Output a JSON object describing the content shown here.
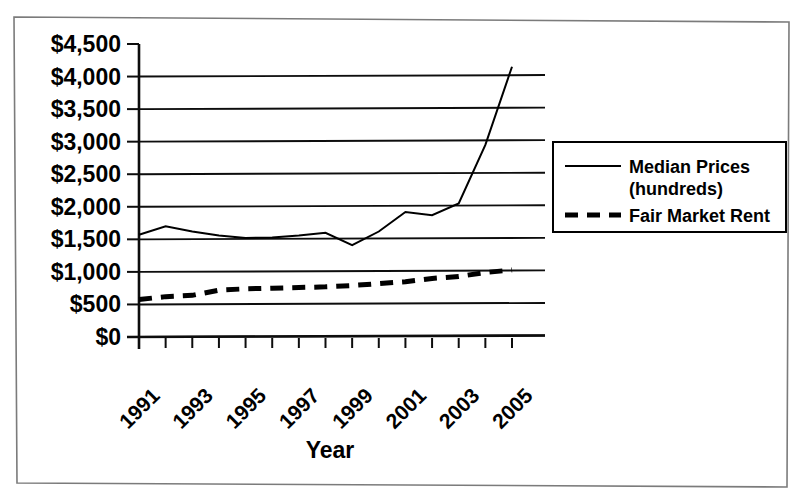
{
  "chart_data": {
    "type": "line",
    "title": "",
    "xlabel": "Year",
    "ylabel": "",
    "grid": true,
    "legend_position": "right",
    "x": [
      1991,
      1992,
      1993,
      1994,
      1995,
      1996,
      1997,
      1998,
      1999,
      2000,
      2001,
      2002,
      2003,
      2004,
      2005
    ],
    "xtick_labels": [
      "1991",
      "1993",
      "1995",
      "1997",
      "1999",
      "2001",
      "2003",
      "2005"
    ],
    "xtick_years": [
      1991,
      1993,
      1995,
      1997,
      1999,
      2001,
      2003,
      2005
    ],
    "ytick_labels": [
      "$4,500",
      "$4,000",
      "$3,500",
      "$3,000",
      "$2,500",
      "$2,000",
      "$1,500",
      "$1,000",
      "$500",
      "$0"
    ],
    "ytick_values": [
      4500,
      4000,
      3500,
      3000,
      2500,
      2000,
      1500,
      1000,
      500,
      0
    ],
    "ylim": [
      0,
      4500
    ],
    "xlim": [
      1991,
      2005
    ],
    "series": [
      {
        "name": "Median Prices (hundreds)",
        "style": "solid",
        "color": "#000000",
        "values": [
          1570,
          1700,
          1620,
          1560,
          1520,
          1530,
          1560,
          1600,
          1410,
          1620,
          1920,
          1870,
          2050,
          2950,
          4150
        ]
      },
      {
        "name": "Fair Market Rent",
        "style": "dashed",
        "color": "#000000",
        "values": [
          575,
          620,
          640,
          720,
          740,
          750,
          760,
          770,
          790,
          820,
          850,
          900,
          930,
          990,
          1030
        ]
      }
    ]
  },
  "legend": {
    "entries": [
      {
        "label_line1": "Median Prices",
        "label_line2": "(hundreds)",
        "style": "solid"
      },
      {
        "label_line1": "Fair Market Rent",
        "label_line2": "",
        "style": "dashed"
      }
    ]
  },
  "axis": {
    "x_title": "Year"
  }
}
